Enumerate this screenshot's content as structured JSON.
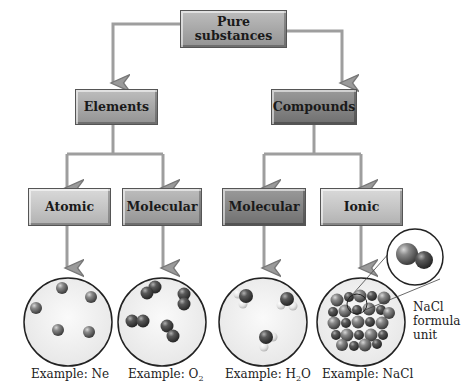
{
  "diagram": {
    "root": {
      "label_line1": "Pure",
      "label_line2": "substances"
    },
    "level2": [
      {
        "label": "Elements"
      },
      {
        "label": "Compounds"
      }
    ],
    "level3": [
      {
        "label": "Atomic"
      },
      {
        "label": "Molecular"
      },
      {
        "label": "Molecular"
      },
      {
        "label": "Ionic"
      }
    ],
    "examples": [
      {
        "prefix": "Example: ",
        "formula": "Ne",
        "sub": "",
        "tail": ""
      },
      {
        "prefix": "Example: ",
        "formula": "O",
        "sub": "2",
        "tail": ""
      },
      {
        "prefix": "Example: ",
        "formula": "H",
        "sub": "2",
        "tail": "O"
      },
      {
        "prefix": "Example: ",
        "formula": "NaCl",
        "sub": "",
        "tail": ""
      }
    ],
    "inset_label": {
      "line1": "NaCl",
      "line2": "formula",
      "line3": "unit"
    },
    "colors": {
      "arrow": "#9a9a9a",
      "box_light": "#c8c8c8",
      "box_dark": "#858585",
      "sphere_dark": "#555555"
    }
  }
}
